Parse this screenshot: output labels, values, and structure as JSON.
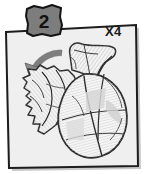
{
  "panel": {
    "name": "assembly-step-panel",
    "background_color": "#efefef",
    "border_color": "#1c1c1c",
    "shadow_color": "#9a9a9a"
  },
  "step_badge": {
    "number": "2",
    "fill_color": "#7d7d7d",
    "border_color": "#141414",
    "text_color": "#111111"
  },
  "quantity_label": {
    "text": "X4",
    "text_color": "#1a1a1a"
  },
  "rotation_arrow": {
    "icon": "curved-arrow-down-left-icon",
    "fill_color": "#8a8a8a",
    "stroke_color": "#4a4a4a",
    "direction": "counter-clockwise"
  },
  "illustration": {
    "icon": "shell-part-line-art",
    "description": "hatched line-art of a shell shaped model piece",
    "line_color": "#2b2b2b",
    "hatch_color": "#b5b5b5",
    "shade_color": "#d0d0d0",
    "parts": [
      {
        "name": "upper-fin-segment"
      },
      {
        "name": "left-crinkled-segment"
      },
      {
        "name": "main-round-body"
      }
    ]
  }
}
